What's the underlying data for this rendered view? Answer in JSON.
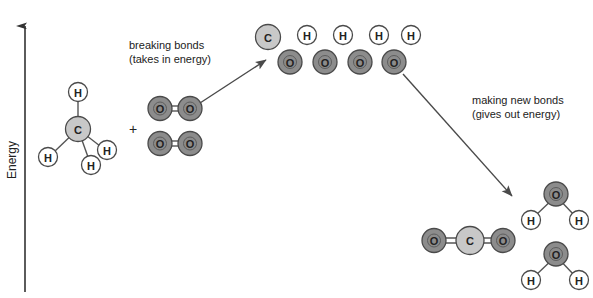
{
  "diagram": {
    "axis": {
      "label": "Energy",
      "direction": "up"
    },
    "annotations": [
      {
        "id": "breaking",
        "line1": "breaking bonds",
        "line2": "(takes in energy)"
      },
      {
        "id": "making",
        "line1": "making new bonds",
        "line2": "(gives out energy)"
      }
    ],
    "operators": {
      "plus": "+"
    },
    "colors": {
      "carbon": "#c8c8c8",
      "oxygen": "#8c8c8c",
      "hydrogen": "#ffffff",
      "outline": "#4a4a4a",
      "bond": "#555555",
      "text": "#222222",
      "arrow": "#4a4a4a",
      "background": "#ffffff"
    },
    "atom_labels": {
      "carbon": "C",
      "oxygen": "O",
      "hydrogen": "H"
    },
    "reactants": {
      "methane": {
        "name": "methane",
        "formula": "CH4",
        "center_atom": "C",
        "outer_atoms": [
          "H",
          "H",
          "H",
          "H"
        ]
      },
      "oxygen_molecules": [
        {
          "name": "oxygen",
          "formula": "O2",
          "atoms": [
            "O",
            "O"
          ],
          "bond": "double"
        },
        {
          "name": "oxygen",
          "formula": "O2",
          "atoms": [
            "O",
            "O"
          ],
          "bond": "double"
        }
      ]
    },
    "transition_state": {
      "name": "separated atoms",
      "top_row": [
        "C",
        "H",
        "H",
        "H",
        "H"
      ],
      "bottom_row": [
        "O",
        "O",
        "O",
        "O"
      ]
    },
    "products": {
      "carbon_dioxide": {
        "name": "carbon dioxide",
        "formula": "CO2",
        "atoms": [
          "O",
          "C",
          "O"
        ],
        "bond": "double"
      },
      "water_molecules": [
        {
          "name": "water",
          "formula": "H2O",
          "atoms": [
            "O",
            "H",
            "H"
          ],
          "bond": "single"
        },
        {
          "name": "water",
          "formula": "H2O",
          "atoms": [
            "O",
            "H",
            "H"
          ],
          "bond": "single"
        }
      ]
    }
  }
}
